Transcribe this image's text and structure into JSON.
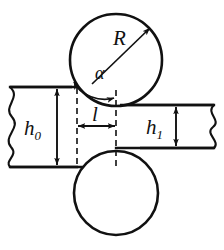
{
  "figure": {
    "type": "engineering-diagram",
    "background_color": "#ffffff",
    "line_color": "#111111"
  },
  "labels": {
    "roll_radius": "R",
    "bite_angle": "α",
    "contact_length": "l",
    "entry_thickness_base": "h",
    "entry_thickness_sub": "0",
    "exit_thickness_base": "h",
    "exit_thickness_sub": "1"
  },
  "geometry": {
    "upper_roll": {
      "cx": 116,
      "cy": 60,
      "r": 46
    },
    "lower_roll": {
      "cx": 116,
      "cy": 193,
      "r": 42
    },
    "entry_slab": {
      "top_y": 87,
      "bottom_y": 167,
      "left_x": 8,
      "right_x": 116
    },
    "exit_slab": {
      "top_y": 105,
      "bottom_y": 148,
      "left_x": 116,
      "right_x": 216
    },
    "dashed_entry_x": 77,
    "dashed_center_x": 116,
    "radius_arrow": {
      "from_x": 116,
      "from_y": 60,
      "to_x": 152,
      "to_y": 26
    },
    "contact_length_dim_y": 126,
    "entry_dim_x": 57,
    "exit_dim_x": 176
  },
  "elements": {
    "upper_roll_name": "upper work roll",
    "lower_roll_name": "lower work roll",
    "entry_slab_name": "incoming strip",
    "exit_slab_name": "outgoing strip",
    "break_line_left": "wavy break line",
    "break_line_right": "wavy break line"
  }
}
